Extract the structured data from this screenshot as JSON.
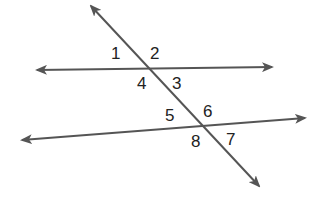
{
  "diagram": {
    "line_color": "#555555",
    "label_color": "#222222",
    "lines": {
      "top_line": {
        "x1": 37,
        "y1": 70,
        "x2": 272,
        "y2": 67
      },
      "bottom_line": {
        "x1": 22,
        "y1": 140,
        "x2": 305,
        "y2": 118
      },
      "transversal": {
        "x1": 91,
        "y1": 6,
        "x2": 259,
        "y2": 186
      }
    },
    "intersections": [
      {
        "name": "upper",
        "x": 149,
        "y": 68
      },
      {
        "name": "lower",
        "x": 202,
        "y": 125
      }
    ],
    "angle_labels": [
      {
        "id": "1",
        "text": "1",
        "x": 111,
        "y": 59
      },
      {
        "id": "2",
        "text": "2",
        "x": 150,
        "y": 59
      },
      {
        "id": "3",
        "text": "3",
        "x": 172,
        "y": 89
      },
      {
        "id": "4",
        "text": "4",
        "x": 137,
        "y": 89
      },
      {
        "id": "5",
        "text": "5",
        "x": 165,
        "y": 121
      },
      {
        "id": "6",
        "text": "6",
        "x": 203,
        "y": 117
      },
      {
        "id": "7",
        "text": "7",
        "x": 226,
        "y": 145
      },
      {
        "id": "8",
        "text": "8",
        "x": 191,
        "y": 147
      }
    ]
  }
}
